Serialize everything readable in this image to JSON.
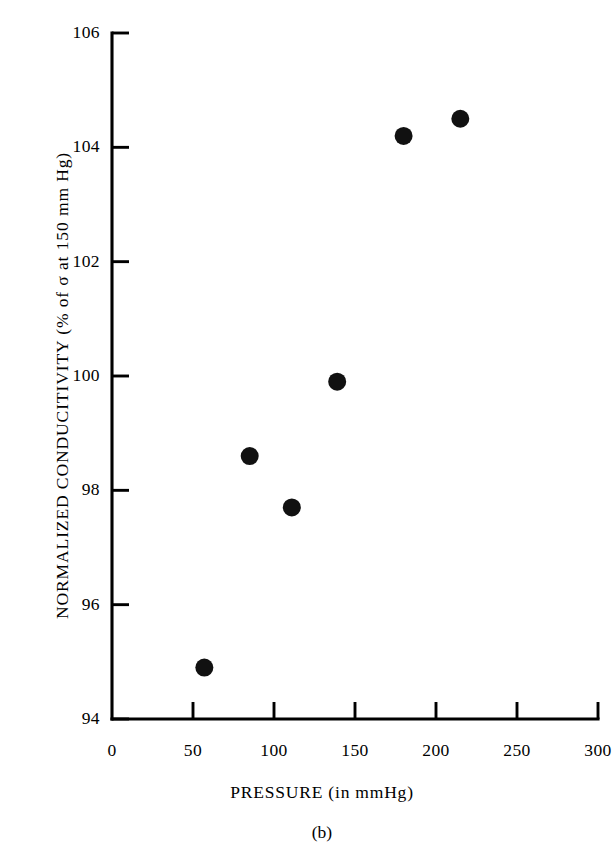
{
  "figure": {
    "caption": "(b)",
    "ink_color": "#111111"
  },
  "chart_data": {
    "type": "scatter",
    "title": "",
    "xlabel": "PRESSURE (in mmHg)",
    "ylabel": "NORMALIZED CONDUCITIVITY (% of σ at 150 mm Hg)",
    "xlim": [
      0,
      300
    ],
    "ylim": [
      94,
      106
    ],
    "xticks": [
      0,
      50,
      100,
      150,
      200,
      250,
      300
    ],
    "yticks": [
      94,
      96,
      98,
      100,
      102,
      104,
      106
    ],
    "xtick_labels": [
      "0",
      "50",
      "100",
      "150",
      "200",
      "250",
      "300"
    ],
    "ytick_labels": [
      "94",
      "96",
      "98",
      "100",
      "102",
      "104",
      "106"
    ],
    "grid": false,
    "legend": false,
    "marker": "filled-circle",
    "marker_color": "#111111",
    "x": [
      57,
      85,
      111,
      139,
      180,
      215
    ],
    "y": [
      94.9,
      98.6,
      97.7,
      99.9,
      104.2,
      104.5
    ],
    "points": [
      {
        "x": 57,
        "y": 94.9
      },
      {
        "x": 85,
        "y": 98.6
      },
      {
        "x": 111,
        "y": 97.7
      },
      {
        "x": 139,
        "y": 99.9
      },
      {
        "x": 180,
        "y": 104.2
      },
      {
        "x": 215,
        "y": 104.5
      }
    ]
  }
}
